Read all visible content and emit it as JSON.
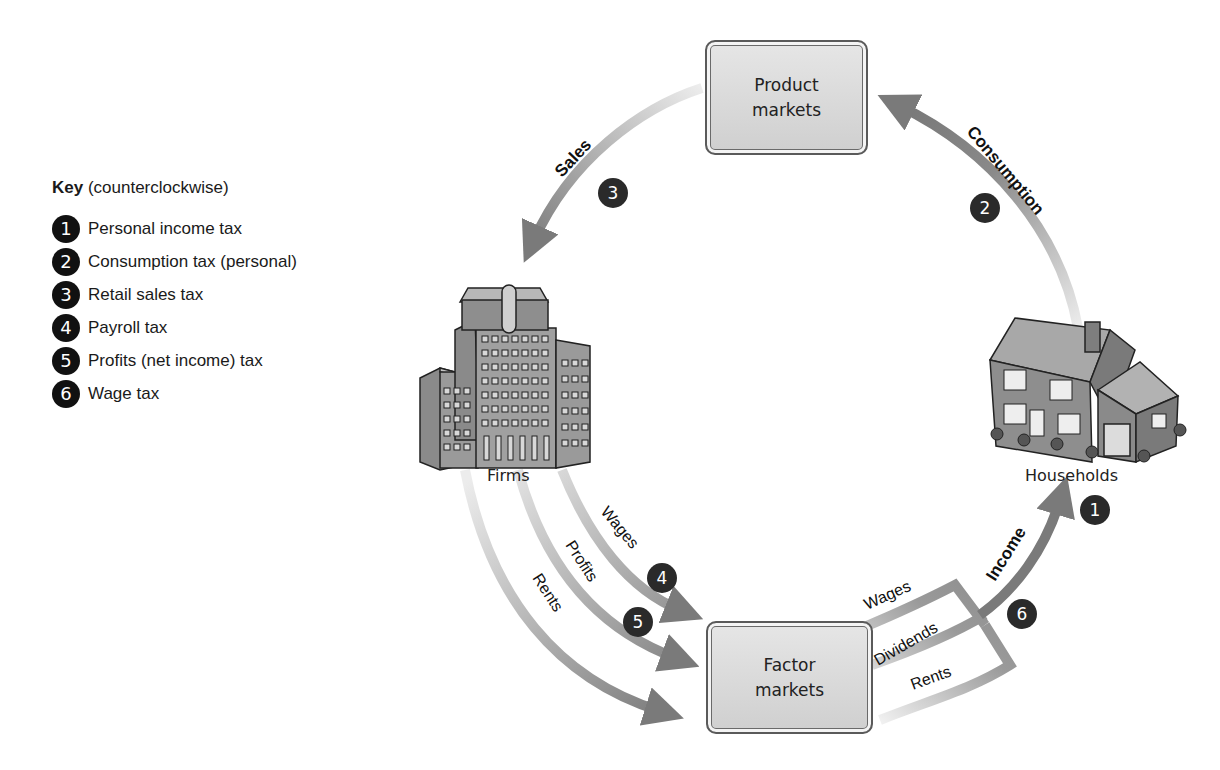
{
  "key": {
    "title_bold": "Key",
    "title_rest": " (counterclockwise)",
    "items": [
      {
        "num": "1",
        "label": "Personal income tax"
      },
      {
        "num": "2",
        "label": "Consumption tax (personal)"
      },
      {
        "num": "3",
        "label": "Retail sales tax"
      },
      {
        "num": "4",
        "label": "Payroll tax"
      },
      {
        "num": "5",
        "label": "Profits (net income) tax"
      },
      {
        "num": "6",
        "label": "Wage tax"
      }
    ]
  },
  "nodes": {
    "product_markets": {
      "line1": "Product",
      "line2": "markets"
    },
    "factor_markets": {
      "line1": "Factor",
      "line2": "markets"
    },
    "firms": {
      "label": "Firms",
      "icon": "building-icon"
    },
    "households": {
      "label": "Households",
      "icon": "house-icon"
    }
  },
  "flows": {
    "sales": "Sales",
    "consumption": "Consumption",
    "income": "Income",
    "firm_wages": "Wages",
    "firm_profits": "Profits",
    "firm_rents": "Rents",
    "hh_wages": "Wages",
    "hh_dividends": "Dividends",
    "hh_rents": "Rents"
  },
  "badges": {
    "b1": "1",
    "b2": "2",
    "b3": "3",
    "b4": "4",
    "b5": "5",
    "b6": "6"
  },
  "colors": {
    "arrow": "#7d7d7d",
    "arrow_light": "#e2e2e2",
    "badge": "#2a2a2a",
    "box_fill": "#dcdcdc"
  }
}
